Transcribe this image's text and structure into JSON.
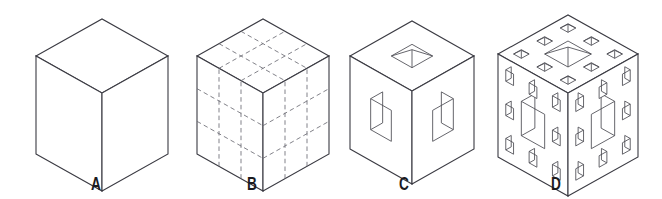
{
  "figure": {
    "background_color": "#ffffff",
    "line_color": "#3b3b43",
    "hidden_line_color": "#6b6b74",
    "label_color": "#1b1b1f",
    "width": 662,
    "height": 199,
    "projection": "isometric"
  },
  "panels": [
    {
      "id": "panel-a",
      "label": "A",
      "label_x": 96,
      "label_y": 190,
      "description": "Solid cube, iteration 0",
      "iteration": 0,
      "holes": 0,
      "center_x": 102,
      "half_width": 66,
      "top_y": 19,
      "rise": 37,
      "side_height": 98,
      "style": "solid"
    },
    {
      "id": "panel-b",
      "label": "B",
      "label_x": 252,
      "label_y": 190,
      "description": "Cube subdivided into a 3 by 3 by 3 grid of 27 subcubes shown with dashed construction lines",
      "iteration": 0,
      "subdivisions": 3,
      "subcubes": 27,
      "holes": 0,
      "center_x": 263,
      "half_width": 66,
      "top_y": 19,
      "rise": 37,
      "side_height": 98,
      "style": "dashed-grid"
    },
    {
      "id": "panel-c",
      "label": "C",
      "label_x": 404,
      "label_y": 190,
      "description": "Menger sponge iteration 1, one square hole through the centre of each face",
      "iteration": 1,
      "holes_per_face": 1,
      "center_x": 412,
      "half_width": 62,
      "top_y": 21,
      "rise": 35,
      "side_height": 93,
      "style": "menger-1"
    },
    {
      "id": "panel-d",
      "label": "D",
      "label_x": 556,
      "label_y": 190,
      "description": "Menger sponge iteration 2, one large central hole plus eight smaller holes on each face",
      "iteration": 2,
      "holes_per_face": 9,
      "center_x": 568,
      "half_width": 70,
      "top_y": 15,
      "rise": 39,
      "side_height": 103,
      "style": "menger-2"
    }
  ]
}
